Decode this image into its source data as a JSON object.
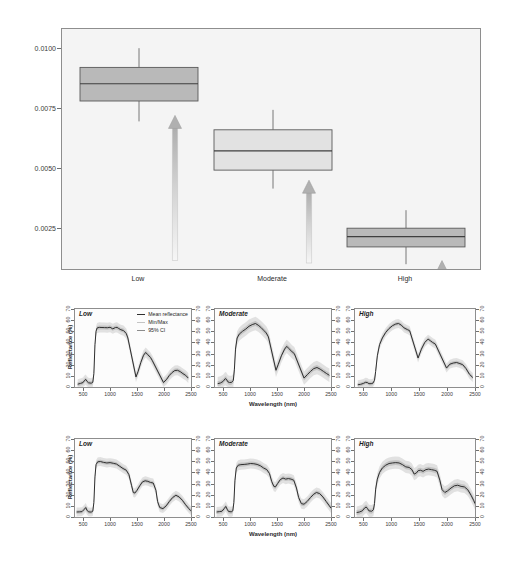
{
  "figure": {
    "background": "#ffffff",
    "panel_background": "#f4f4f4"
  },
  "boxplot": {
    "ylabel": "Water Content (cm)",
    "yticks": [
      "0.0100",
      "0.0075",
      "0.0050",
      "0.0025"
    ],
    "ytick_values": [
      0.01,
      0.0075,
      0.005,
      0.0025
    ],
    "categories": [
      "Low",
      "Moderate",
      "High"
    ],
    "arrow_icon": "up-arrow-icon",
    "colors": {
      "box_dark": "#b9b9b9",
      "box_light": "#e2e2e2",
      "arrow": "#b2b2b2",
      "frame": "#8e8e8e"
    }
  },
  "spectra": {
    "ylabel": "Reflectance (%)",
    "xlabel": "Wavelength (nm)",
    "yticks": [
      "0",
      "10",
      "20",
      "30",
      "40",
      "50",
      "60",
      "70"
    ],
    "xticks": [
      "500",
      "1000",
      "1500",
      "2000",
      "2500"
    ],
    "panel_titles_row1": [
      "Low",
      "Moderate",
      "High"
    ],
    "panel_titles_row2": [
      "Low",
      "Moderate",
      "High"
    ],
    "legend": [
      {
        "label": "Mean reflectance",
        "color": "#2f2f2f"
      },
      {
        "label": "Min/Max",
        "color": "#c4c4c4"
      },
      {
        "label": "95% CI",
        "color": "#8c8c8c"
      }
    ]
  },
  "chart_data": [
    {
      "type": "box",
      "title": "",
      "xlabel": "",
      "ylabel": "Water Content (cm)",
      "ylim": [
        0.0008,
        0.0108
      ],
      "grid": false,
      "categories": [
        "Low",
        "Moderate",
        "High"
      ],
      "boxes": [
        {
          "category": "Low",
          "whisker_low": 0.00695,
          "q1": 0.0078,
          "median": 0.00852,
          "q3": 0.0092,
          "whisker_high": 0.01,
          "fill": "#b9b9b9"
        },
        {
          "category": "Moderate",
          "whisker_low": 0.00415,
          "q1": 0.00492,
          "median": 0.00572,
          "q3": 0.0066,
          "whisker_high": 0.00743,
          "fill": "#e2e2e2"
        },
        {
          "category": "High",
          "whisker_low": 0.001,
          "q1": 0.00172,
          "median": 0.00215,
          "q3": 0.0025,
          "whisker_high": 0.00325,
          "fill": "#b9b9b9"
        }
      ],
      "annotations": [
        {
          "kind": "up-arrow",
          "category": "Low",
          "from": 0.00115,
          "to": 0.0072
        },
        {
          "kind": "up-arrow",
          "category": "Moderate",
          "from": 0.00105,
          "to": 0.0045
        },
        {
          "kind": "up-arrow",
          "category": "High",
          "from": 0.0001,
          "to": 0.00115
        }
      ]
    },
    {
      "type": "line",
      "panel": "row1-low",
      "title": "Low",
      "xlabel": "Wavelength (nm)",
      "ylabel": "Reflectance (%)",
      "xlim": [
        350,
        2500
      ],
      "ylim": [
        0,
        70
      ],
      "grid": false,
      "legend_position": "top-right",
      "series": [
        {
          "name": "Mean reflectance",
          "color": "#2f2f2f",
          "x": [
            400,
            450,
            500,
            520,
            550,
            570,
            600,
            650,
            680,
            700,
            720,
            740,
            760,
            800,
            850,
            900,
            950,
            1000,
            1050,
            1100,
            1130,
            1160,
            1200,
            1250,
            1300,
            1330,
            1480,
            1520,
            1570,
            1620,
            1660,
            1700,
            1750,
            1780,
            1990,
            2050,
            2100,
            2150,
            2200,
            2250,
            2300,
            2350,
            2400,
            2450
          ],
          "y": [
            2.5,
            3.2,
            4.0,
            5.5,
            6.8,
            5.2,
            3.8,
            3.4,
            4.2,
            12.0,
            38.0,
            50.0,
            53.0,
            53.5,
            53.4,
            53.3,
            53.2,
            53.6,
            52.2,
            53.4,
            53.5,
            52.5,
            51.4,
            50.6,
            48.0,
            44.0,
            9.0,
            14.0,
            22.0,
            28.5,
            31.0,
            29.0,
            26.5,
            24.0,
            4.0,
            7.0,
            10.5,
            13.0,
            14.8,
            15.0,
            13.8,
            12.0,
            10.5,
            8.0
          ]
        }
      ],
      "bands": [
        {
          "name": "Min/Max",
          "color": "#cfcfcf",
          "half_width": 4.5
        },
        {
          "name": "95% CI",
          "color": "#9a9a9a",
          "half_width": 1.8
        }
      ],
      "gaps": [
        [
          1330,
          1480
        ],
        [
          1780,
          1990
        ]
      ]
    },
    {
      "type": "line",
      "panel": "row1-moderate",
      "title": "Moderate",
      "xlabel": "Wavelength (nm)",
      "ylabel": "Reflectance (%)",
      "xlim": [
        350,
        2500
      ],
      "ylim": [
        0,
        70
      ],
      "grid": false,
      "series": [
        {
          "name": "Mean reflectance",
          "color": "#2f2f2f",
          "x": [
            400,
            450,
            500,
            540,
            560,
            590,
            620,
            660,
            690,
            710,
            730,
            760,
            800,
            860,
            920,
            980,
            1040,
            1100,
            1150,
            1200,
            1260,
            1300,
            1340,
            1480,
            1520,
            1580,
            1640,
            1680,
            1720,
            1780,
            1820,
            2000,
            2060,
            2120,
            2180,
            2240,
            2300,
            2360,
            2420,
            2470
          ],
          "y": [
            3.0,
            3.6,
            5.0,
            7.5,
            7.0,
            4.6,
            4.0,
            4.2,
            6.0,
            16.0,
            34.0,
            44.0,
            47.5,
            50.0,
            52.0,
            54.5,
            56.0,
            57.0,
            55.5,
            53.5,
            50.5,
            48.5,
            45.0,
            15.0,
            20.0,
            28.0,
            34.0,
            36.5,
            34.5,
            31.5,
            30.0,
            8.0,
            11.0,
            14.0,
            16.5,
            17.5,
            16.0,
            14.0,
            12.0,
            10.5
          ]
        }
      ],
      "bands": [
        {
          "name": "Min/Max",
          "color": "#cfcfcf",
          "half_width": 6.0
        },
        {
          "name": "95% CI",
          "color": "#9a9a9a",
          "half_width": 2.2
        }
      ],
      "gaps": [
        [
          1340,
          1480
        ],
        [
          1820,
          2000
        ]
      ]
    },
    {
      "type": "line",
      "panel": "row1-high",
      "title": "High",
      "xlabel": "Wavelength (nm)",
      "ylabel": "Reflectance (%)",
      "xlim": [
        350,
        2500
      ],
      "ylim": [
        0,
        70
      ],
      "grid": false,
      "series": [
        {
          "name": "Mean reflectance",
          "color": "#2f2f2f",
          "x": [
            400,
            450,
            500,
            540,
            570,
            600,
            640,
            670,
            700,
            720,
            750,
            790,
            840,
            900,
            960,
            1020,
            1080,
            1130,
            1180,
            1230,
            1290,
            1330,
            1480,
            1540,
            1600,
            1660,
            1700,
            1740,
            1790,
            1990,
            2050,
            2110,
            2170,
            2230,
            2280,
            2340,
            2400,
            2460
          ],
          "y": [
            2.0,
            2.4,
            3.2,
            4.2,
            4.0,
            3.0,
            3.0,
            3.4,
            6.0,
            14.0,
            28.0,
            38.0,
            44.0,
            49.0,
            52.5,
            55.0,
            56.5,
            57.0,
            55.5,
            53.0,
            51.5,
            50.5,
            26.0,
            34.0,
            40.0,
            43.0,
            41.5,
            40.0,
            38.5,
            17.0,
            20.5,
            21.5,
            22.0,
            21.0,
            20.0,
            16.5,
            11.5,
            8.5
          ]
        }
      ],
      "bands": [
        {
          "name": "Min/Max",
          "color": "#cfcfcf",
          "half_width": 4.0
        },
        {
          "name": "95% CI",
          "color": "#9a9a9a",
          "half_width": 1.6
        }
      ],
      "gaps": [
        [
          1330,
          1480
        ],
        [
          1790,
          1990
        ]
      ]
    },
    {
      "type": "line",
      "panel": "row2-low",
      "title": "Low",
      "xlabel": "Wavelength (nm)",
      "ylabel": "Reflectance (%)",
      "xlim": [
        350,
        2500
      ],
      "ylim": [
        0,
        70
      ],
      "grid": false,
      "series": [
        {
          "name": "Mean reflectance",
          "color": "#2f2f2f",
          "x": [
            380,
            430,
            480,
            520,
            550,
            570,
            600,
            650,
            680,
            700,
            720,
            740,
            770,
            820,
            880,
            940,
            1000,
            1060,
            1120,
            1180,
            1240,
            1300,
            1350,
            1400,
            1430,
            1460,
            1500,
            1550,
            1600,
            1650,
            1700,
            1750,
            1800,
            1850,
            1880,
            1920,
            1980,
            2040,
            2100,
            2160,
            2220,
            2280,
            2340,
            2400,
            2460,
            2500
          ],
          "y": [
            4.5,
            4.6,
            4.8,
            6.8,
            8.5,
            6.2,
            4.6,
            4.4,
            5.2,
            13.0,
            36.0,
            47.0,
            49.5,
            49.8,
            49.0,
            48.5,
            48.8,
            48.2,
            47.5,
            45.5,
            43.5,
            42.0,
            38.0,
            28.0,
            22.0,
            21.5,
            24.0,
            28.0,
            31.5,
            32.5,
            32.0,
            31.0,
            30.5,
            24.0,
            14.0,
            8.5,
            7.5,
            10.0,
            14.0,
            17.5,
            19.5,
            18.0,
            15.0,
            11.0,
            7.5,
            5.5
          ]
        }
      ],
      "bands": [
        {
          "name": "Min/Max",
          "color": "#cfcfcf",
          "half_width": 4.0
        },
        {
          "name": "95% CI",
          "color": "#9a9a9a",
          "half_width": 1.6
        }
      ],
      "gaps": []
    },
    {
      "type": "line",
      "panel": "row2-moderate",
      "title": "Moderate",
      "xlabel": "Wavelength (nm)",
      "ylabel": "Reflectance (%)",
      "xlim": [
        350,
        2500
      ],
      "ylim": [
        0,
        70
      ],
      "grid": false,
      "series": [
        {
          "name": "Mean reflectance",
          "color": "#2f2f2f",
          "x": [
            380,
            430,
            480,
            520,
            550,
            575,
            600,
            650,
            680,
            700,
            720,
            745,
            780,
            830,
            890,
            950,
            1010,
            1070,
            1130,
            1190,
            1250,
            1310,
            1360,
            1400,
            1440,
            1470,
            1510,
            1560,
            1610,
            1660,
            1710,
            1760,
            1810,
            1860,
            1900,
            1950,
            2000,
            2060,
            2120,
            2180,
            2230,
            2290,
            2350,
            2410,
            2470,
            2500
          ],
          "y": [
            4.5,
            4.8,
            5.2,
            7.5,
            9.5,
            7.0,
            5.0,
            4.6,
            5.5,
            13.0,
            33.0,
            44.0,
            46.5,
            47.0,
            47.2,
            47.5,
            48.0,
            47.8,
            47.2,
            46.0,
            44.0,
            42.5,
            39.0,
            32.0,
            27.5,
            27.0,
            30.0,
            33.5,
            35.0,
            34.0,
            34.5,
            34.0,
            33.0,
            26.0,
            17.5,
            12.0,
            11.5,
            14.0,
            17.5,
            20.5,
            22.0,
            21.0,
            18.0,
            14.0,
            10.0,
            8.0
          ]
        }
      ],
      "bands": [
        {
          "name": "Min/Max",
          "color": "#cfcfcf",
          "half_width": 4.5
        },
        {
          "name": "95% CI",
          "color": "#9a9a9a",
          "half_width": 1.8
        }
      ],
      "gaps": []
    },
    {
      "type": "line",
      "panel": "row2-high",
      "title": "High",
      "xlabel": "Wavelength (nm)",
      "ylabel": "Reflectance (%)",
      "xlim": [
        350,
        2500
      ],
      "ylim": [
        0,
        70
      ],
      "grid": false,
      "series": [
        {
          "name": "Mean reflectance",
          "color": "#2f2f2f",
          "x": [
            380,
            430,
            480,
            520,
            550,
            575,
            600,
            650,
            680,
            700,
            720,
            750,
            790,
            840,
            900,
            960,
            1020,
            1080,
            1140,
            1200,
            1260,
            1320,
            1370,
            1410,
            1450,
            1480,
            1520,
            1570,
            1620,
            1670,
            1720,
            1770,
            1820,
            1870,
            1910,
            1960,
            2010,
            2070,
            2130,
            2190,
            2250,
            2310,
            2370,
            2430,
            2480,
            2500
          ],
          "y": [
            4.0,
            4.5,
            5.5,
            8.0,
            9.0,
            7.5,
            5.5,
            5.2,
            6.5,
            12.0,
            25.0,
            34.0,
            40.0,
            44.0,
            46.5,
            48.0,
            48.5,
            48.8,
            48.5,
            47.0,
            45.0,
            44.5,
            42.5,
            38.5,
            39.5,
            41.5,
            42.0,
            41.0,
            42.5,
            43.0,
            42.5,
            42.0,
            41.0,
            33.0,
            24.5,
            22.0,
            23.5,
            26.0,
            28.0,
            28.5,
            27.5,
            27.0,
            24.5,
            19.5,
            14.5,
            12.0
          ]
        }
      ],
      "bands": [
        {
          "name": "Min/Max",
          "color": "#cfcfcf",
          "half_width": 5.5
        },
        {
          "name": "95% CI",
          "color": "#9a9a9a",
          "half_width": 2.2
        }
      ],
      "gaps": []
    }
  ]
}
